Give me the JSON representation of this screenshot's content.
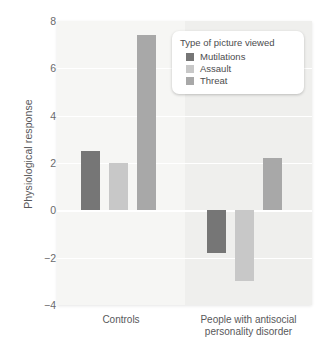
{
  "chart_data": {
    "type": "bar",
    "title": "",
    "xlabel": "",
    "ylabel": "Physiological response",
    "ylim": [
      -4,
      8
    ],
    "yticks": [
      8,
      6,
      4,
      2,
      0,
      -2,
      -4
    ],
    "ytick_labels": [
      "8",
      "6",
      "4",
      "2",
      "0",
      "−2",
      "−4"
    ],
    "grid": true,
    "legend_position": "top-right",
    "legend_title": "Type of picture viewed",
    "categories": [
      "Controls",
      "People with antisocial personality disorder"
    ],
    "category_lines": [
      [
        "Controls"
      ],
      [
        "People with antisocial",
        "personality disorder"
      ]
    ],
    "series": [
      {
        "name": "Mutilations",
        "color": "#767676",
        "values": [
          2.5,
          -1.8
        ]
      },
      {
        "name": "Assault",
        "color": "#c8c8c8",
        "values": [
          2.0,
          -3.0
        ]
      },
      {
        "name": "Threat",
        "color": "#a8a8a8",
        "values": [
          7.4,
          2.2
        ]
      }
    ]
  },
  "axis": {
    "ylabel": "Physiological response",
    "tick_8": "8",
    "tick_6": "6",
    "tick_4": "4",
    "tick_2": "2",
    "tick_0": "0",
    "tick_m2": "−2",
    "tick_m4": "−4"
  },
  "legend": {
    "title": "Type of picture viewed",
    "items": [
      {
        "label": "Mutilations",
        "color": "#767676"
      },
      {
        "label": "Assault",
        "color": "#c8c8c8"
      },
      {
        "label": "Threat",
        "color": "#a8a8a8"
      }
    ]
  },
  "xaxis": {
    "group_0_line_0": "Controls",
    "group_1_line_0": "People with antisocial",
    "group_1_line_1": "personality disorder"
  }
}
